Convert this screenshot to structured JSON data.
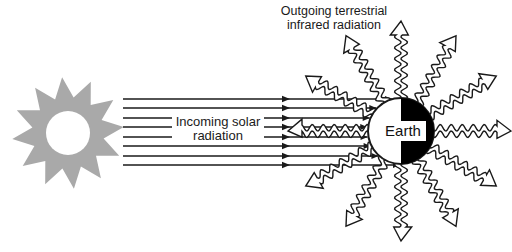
{
  "diagram": {
    "labels": {
      "incoming_line1": "Incoming solar",
      "incoming_line2": "radiation",
      "outgoing_line1": "Outgoing terrestrial",
      "outgoing_line2": "infrared radiation",
      "earth": "Earth"
    },
    "colors": {
      "sun": "#a9a9a9",
      "line": "#1a1a1a",
      "background": "#ffffff",
      "earth_dark_half": "#000000",
      "earth_light_half": "#ffffff"
    },
    "sun": {
      "cx": 68,
      "cy": 133,
      "outer_r": 56,
      "inner_r": 36,
      "circle_r": 22,
      "points": 12
    },
    "incoming_rays": {
      "count": 8,
      "x_start": 123,
      "x_arrow1": 290,
      "x_end": 368,
      "y_positions": [
        99,
        108,
        118,
        127,
        137,
        146,
        156,
        165
      ]
    },
    "earth": {
      "cx": 401,
      "cy": 131,
      "r": 33
    },
    "outgoing_arrows": {
      "count": 12,
      "angles_deg": [
        0,
        30,
        60,
        90,
        120,
        150,
        180,
        210,
        240,
        270,
        300,
        330
      ],
      "length": 110
    }
  }
}
